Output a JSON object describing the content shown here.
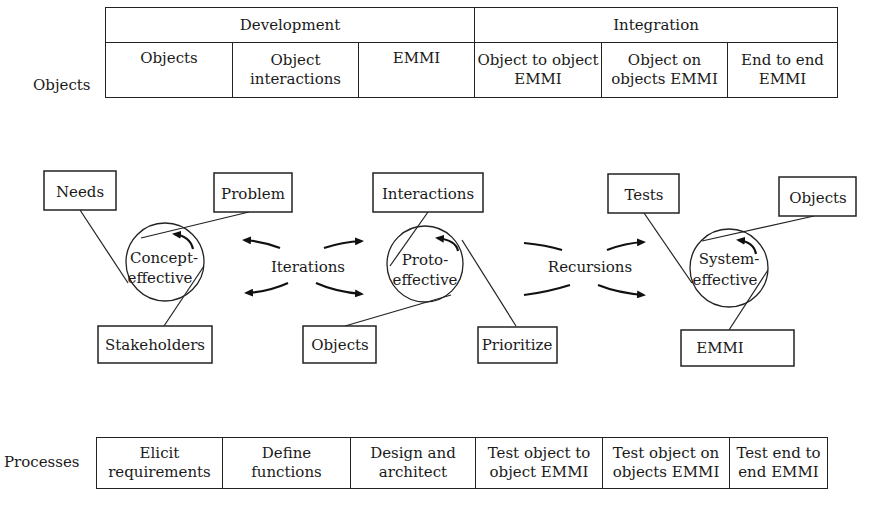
{
  "objects_table": {
    "row_label": "Objects",
    "groups": [
      {
        "label": "Development",
        "cells": [
          "Objects",
          "Object interactions",
          "EMMI"
        ]
      },
      {
        "label": "Integration",
        "cells": [
          "Object to object EMMI",
          "Object on objects EMMI",
          "End to end EMMI"
        ]
      }
    ]
  },
  "flow": {
    "stages": [
      {
        "label_line1": "Concept-",
        "label_line2": "effective",
        "inputs": [
          "Needs",
          "Problem",
          "Stakeholders"
        ]
      },
      {
        "label_line1": "Proto-",
        "label_line2": "effective",
        "inputs": [
          "Interactions",
          "Objects",
          "Prioritize"
        ]
      },
      {
        "label_line1": "System-",
        "label_line2": "effective",
        "inputs": [
          "Tests",
          "Objects",
          "EMMI"
        ]
      }
    ],
    "transitions": [
      {
        "label": "Iterations",
        "between": [
          "Concept-effective",
          "Proto-effective"
        ]
      },
      {
        "label": "Recursions",
        "between": [
          "Proto-effective",
          "System-effective"
        ]
      }
    ]
  },
  "processes_table": {
    "row_label": "Processes",
    "cells": [
      "Elicit requirements",
      "Define functions",
      "Design and architect",
      "Test object to object EMMI",
      "Test object on objects EMMI",
      "Test end to end EMMI"
    ]
  }
}
